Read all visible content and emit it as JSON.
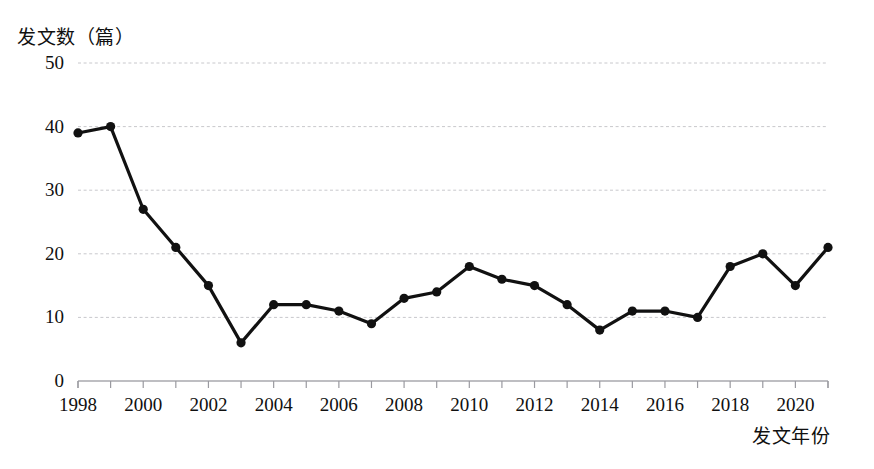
{
  "chart_data": {
    "type": "line",
    "title": "",
    "ylabel": "发文数（篇）",
    "xlabel": "发文年份",
    "xlim": [
      1997.5,
      2021.5
    ],
    "ylim": [
      0,
      50
    ],
    "yticks": [
      0,
      10,
      20,
      30,
      40,
      50
    ],
    "xticks": [
      1998,
      2000,
      2002,
      2004,
      2006,
      2008,
      2010,
      2012,
      2014,
      2016,
      2018,
      2020
    ],
    "grid": "horizontal-dashed",
    "legend": "none",
    "x": [
      1998,
      1999,
      2000,
      2001,
      2002,
      2003,
      2004,
      2005,
      2006,
      2007,
      2008,
      2009,
      2010,
      2011,
      2012,
      2013,
      2014,
      2015,
      2016,
      2017,
      2018,
      2019,
      2020,
      2021
    ],
    "values": [
      39,
      40,
      27,
      21,
      15,
      6,
      12,
      12,
      11,
      9,
      13,
      14,
      18,
      16,
      15,
      12,
      8,
      11,
      11,
      10,
      18,
      20,
      15,
      21
    ],
    "series": [
      {
        "name": "发文数",
        "values": [
          39,
          40,
          27,
          21,
          15,
          6,
          12,
          12,
          11,
          9,
          13,
          14,
          18,
          16,
          15,
          12,
          8,
          11,
          11,
          10,
          18,
          20,
          15,
          21
        ]
      }
    ],
    "line_color": "#111111",
    "marker_color": "#111111",
    "grid_color": "#c8c8cc"
  }
}
